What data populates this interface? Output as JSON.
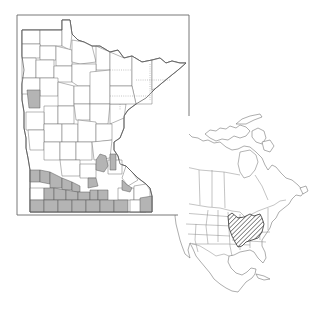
{
  "figure": {
    "type": "species-distribution-map",
    "inset": {
      "region": "Minnesota",
      "unit": "county",
      "occupied_fill": "#b4b4b4",
      "unoccupied_fill": "#ffffff",
      "occupied_counties_description": "southern tiers of counties, one west-central county, Twin Cities metro area, and southeastern river counties"
    },
    "main_map": {
      "region": "North America",
      "range_style": "diagonal hatch",
      "range_description": "Midwestern / Ohio Valley United States"
    },
    "colors": {
      "frame": "#6a6a6a",
      "outline": "#6e6e6e",
      "hatch": "#333333",
      "background": "#ffffff"
    }
  }
}
